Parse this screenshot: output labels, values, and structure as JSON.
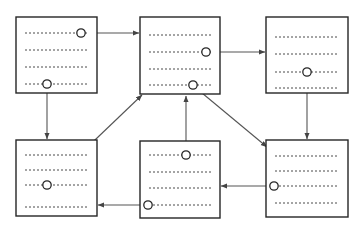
{
  "diagram": {
    "canvas": {
      "width": 361,
      "height": 234,
      "background": "#ffffff"
    },
    "style": {
      "box_stroke": "#262626",
      "box_fill": "#ffffff",
      "box_stroke_width": 1.4,
      "text_line_color": "#4a4a4a",
      "text_line_dash": "2,2",
      "connector_color": "#555555",
      "connector_width": 1.1,
      "node_stroke": "#262626",
      "node_fill": "#ffffff",
      "node_radius": 4.2
    },
    "boxes": [
      {
        "id": "box-1",
        "name": "document-box-top-left",
        "x": 16,
        "y": 17,
        "w": 81,
        "h": 76,
        "lines": [
          {
            "x1": 25,
            "x2": 88,
            "y": 33
          },
          {
            "x1": 25,
            "x2": 88,
            "y": 50
          },
          {
            "x1": 25,
            "x2": 88,
            "y": 67
          },
          {
            "x1": 25,
            "x2": 88,
            "y": 84
          }
        ]
      },
      {
        "id": "box-2",
        "name": "document-box-top-center",
        "x": 140,
        "y": 17,
        "w": 80,
        "h": 77,
        "lines": [
          {
            "x1": 149,
            "x2": 212,
            "y": 35
          },
          {
            "x1": 149,
            "x2": 212,
            "y": 52
          },
          {
            "x1": 149,
            "x2": 212,
            "y": 69
          },
          {
            "x1": 149,
            "x2": 212,
            "y": 85
          }
        ]
      },
      {
        "id": "box-3",
        "name": "document-box-top-right",
        "x": 266,
        "y": 17,
        "w": 82,
        "h": 76,
        "lines": [
          {
            "x1": 275,
            "x2": 339,
            "y": 37
          },
          {
            "x1": 275,
            "x2": 339,
            "y": 54
          },
          {
            "x1": 275,
            "x2": 339,
            "y": 72
          },
          {
            "x1": 275,
            "x2": 339,
            "y": 88
          }
        ]
      },
      {
        "id": "box-4",
        "name": "document-box-bottom-left",
        "x": 16,
        "y": 140,
        "w": 81,
        "h": 76,
        "lines": [
          {
            "x1": 25,
            "x2": 88,
            "y": 155
          },
          {
            "x1": 25,
            "x2": 88,
            "y": 170
          },
          {
            "x1": 25,
            "x2": 88,
            "y": 185
          },
          {
            "x1": 25,
            "x2": 88,
            "y": 207
          }
        ]
      },
      {
        "id": "box-5",
        "name": "document-box-bottom-center",
        "x": 140,
        "y": 141,
        "w": 80,
        "h": 77,
        "lines": [
          {
            "x1": 149,
            "x2": 212,
            "y": 155
          },
          {
            "x1": 149,
            "x2": 212,
            "y": 172
          },
          {
            "x1": 149,
            "x2": 212,
            "y": 188
          },
          {
            "x1": 149,
            "x2": 212,
            "y": 205
          }
        ]
      },
      {
        "id": "box-6",
        "name": "document-box-bottom-right",
        "x": 266,
        "y": 140,
        "w": 82,
        "h": 77,
        "lines": [
          {
            "x1": 275,
            "x2": 339,
            "y": 156
          },
          {
            "x1": 275,
            "x2": 339,
            "y": 171
          },
          {
            "x1": 275,
            "x2": 339,
            "y": 186
          },
          {
            "x1": 275,
            "x2": 339,
            "y": 203
          }
        ]
      }
    ],
    "nodes": [
      {
        "id": "node-1",
        "name": "link-node-box1-line1",
        "box": "box-1",
        "line": 1,
        "cx": 81,
        "cy": 33
      },
      {
        "id": "node-2",
        "name": "link-node-box1-line4",
        "box": "box-1",
        "line": 4,
        "cx": 47,
        "cy": 84
      },
      {
        "id": "node-3",
        "name": "link-node-box2-line2",
        "box": "box-2",
        "line": 2,
        "cx": 206,
        "cy": 52
      },
      {
        "id": "node-4",
        "name": "link-node-box2-line4",
        "box": "box-2",
        "line": 4,
        "cx": 193,
        "cy": 85
      },
      {
        "id": "node-5",
        "name": "link-node-box3-line3",
        "box": "box-3",
        "line": 3,
        "cx": 307,
        "cy": 72
      },
      {
        "id": "node-6",
        "name": "link-node-box4-line3",
        "box": "box-4",
        "line": 3,
        "cx": 47,
        "cy": 185
      },
      {
        "id": "node-7",
        "name": "link-node-box5-line1",
        "box": "box-5",
        "line": 1,
        "cx": 186,
        "cy": 155
      },
      {
        "id": "node-8",
        "name": "link-node-box5-line4",
        "box": "box-5",
        "line": 4,
        "cx": 148,
        "cy": 205
      },
      {
        "id": "node-9",
        "name": "link-node-box6-line3",
        "box": "box-6",
        "line": 3,
        "cx": 274,
        "cy": 186
      }
    ],
    "connectors": [
      {
        "id": "arrow-1",
        "name": "arrow-box1-to-box2",
        "from": "node-1",
        "to": "box-2",
        "x1": 85,
        "y1": 33,
        "x2": 139,
        "y2": 33,
        "direction": "right"
      },
      {
        "id": "arrow-2",
        "name": "arrow-box1-to-box4",
        "from": "node-2",
        "to": "box-4",
        "x1": 47,
        "y1": 88,
        "x2": 47,
        "y2": 139,
        "direction": "down"
      },
      {
        "id": "arrow-3",
        "name": "arrow-box2-to-box3",
        "from": "node-3",
        "to": "box-3",
        "x1": 210,
        "y1": 52,
        "x2": 265,
        "y2": 52,
        "direction": "right"
      },
      {
        "id": "arrow-4",
        "name": "arrow-box2-to-box6",
        "from": "node-4",
        "to": "box-6",
        "x1": 196,
        "y1": 88,
        "x2": 267,
        "y2": 147,
        "direction": "down-right"
      },
      {
        "id": "arrow-5",
        "name": "arrow-box3-to-box6",
        "from": "node-5",
        "to": "box-6",
        "x1": 307,
        "y1": 76,
        "x2": 307,
        "y2": 139,
        "direction": "down"
      },
      {
        "id": "arrow-6",
        "name": "arrow-box4-to-box2",
        "from": "node-6",
        "to": "box-2",
        "x1": 51,
        "y1": 182,
        "x2": 142,
        "y2": 95,
        "direction": "up-right"
      },
      {
        "id": "arrow-7",
        "name": "arrow-box5-to-box2",
        "from": "node-7",
        "to": "box-2",
        "x1": 186,
        "y1": 151,
        "x2": 186,
        "y2": 96,
        "direction": "up"
      },
      {
        "id": "arrow-8",
        "name": "arrow-box5-to-box4",
        "from": "node-8",
        "to": "box-4",
        "x1": 144,
        "y1": 205,
        "x2": 98,
        "y2": 205,
        "direction": "left"
      },
      {
        "id": "arrow-9",
        "name": "arrow-box6-to-box5",
        "from": "node-9",
        "to": "box-5",
        "x1": 270,
        "y1": 186,
        "x2": 221,
        "y2": 186,
        "direction": "left"
      }
    ]
  }
}
